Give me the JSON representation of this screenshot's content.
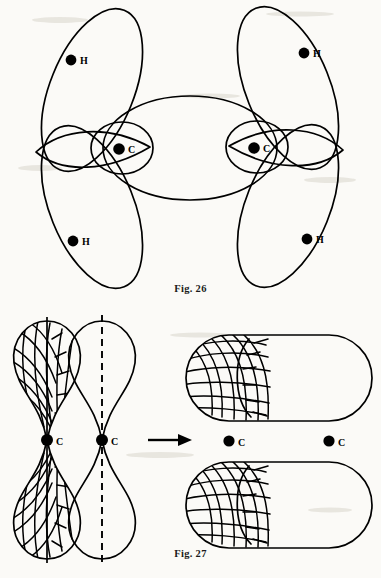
{
  "page": {
    "background_color": "#fbfaf7",
    "ink_color": "#000000",
    "width": 381,
    "height": 578
  },
  "figures": [
    {
      "id": "fig26",
      "caption": "Fig. 26",
      "subject": "sigma-bond-framework-of-ethylene",
      "description": "Four tilted hybrid orbital lobes bearing hydrogens, two small lens shaped orbitals at the carbons, and one large central ellipse for the carbon-carbon bond",
      "atoms": [
        {
          "element": "H",
          "label": "H",
          "position": "upper-left",
          "x": 71,
          "y": 60
        },
        {
          "element": "H",
          "label": "H",
          "position": "upper-right",
          "x": 304,
          "y": 53
        },
        {
          "element": "C",
          "label": "C",
          "position": "center-left",
          "x": 122,
          "y": 149
        },
        {
          "element": "C",
          "label": "C",
          "position": "center-right",
          "x": 257,
          "y": 148
        },
        {
          "element": "H",
          "label": "H",
          "position": "lower-left",
          "x": 73,
          "y": 241
        },
        {
          "element": "H",
          "label": "H",
          "position": "lower-right",
          "x": 307,
          "y": 239
        }
      ]
    },
    {
      "id": "fig27",
      "caption": "Fig. 27",
      "subject": "p-orbital-overlap-forming-pi-bond",
      "description": "Left: two crossing figure-eight p orbitals with cross hatched lobes, a solid axis through the left carbon and a dashed axis through the right carbon. Right: the resulting pi electron cloud drawn as two hatched capsule shapes above and below the carbon axis.",
      "arrow": {
        "label": "yields-arrow",
        "direction": "right"
      },
      "left_panel": {
        "atoms": [
          {
            "element": "C",
            "label": "C",
            "x": 47,
            "y": 440
          },
          {
            "element": "C",
            "label": "C",
            "x": 102,
            "y": 440
          }
        ],
        "axes": [
          {
            "style": "solid",
            "through": "left-carbon"
          },
          {
            "style": "dashed",
            "through": "right-carbon"
          }
        ]
      },
      "right_panel": {
        "atoms": [
          {
            "element": "C",
            "label": "C",
            "x": 229,
            "y": 440
          },
          {
            "element": "C",
            "label": "C",
            "x": 329,
            "y": 440
          }
        ],
        "clouds": [
          {
            "label": "upper-pi-lobe",
            "hatched_end": "left"
          },
          {
            "label": "lower-pi-lobe",
            "hatched_end": "left"
          }
        ]
      }
    }
  ]
}
